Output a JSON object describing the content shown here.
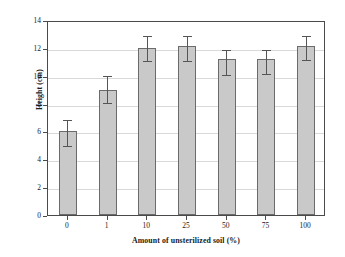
{
  "chart_data": {
    "type": "bar",
    "title": "",
    "xlabel": "Amount of unsterilized soil (%)",
    "ylabel": "Height (cm)",
    "categories": [
      "0",
      "1",
      "10",
      "25",
      "50",
      "75",
      "100"
    ],
    "values": [
      6.0,
      9.0,
      12.0,
      12.1,
      11.2,
      11.2,
      12.1
    ],
    "errors_upper": [
      7.0,
      10.1,
      13.0,
      13.0,
      12.0,
      12.0,
      13.0
    ],
    "errors_lower": [
      5.0,
      8.1,
      11.1,
      11.1,
      10.1,
      10.2,
      11.2
    ],
    "ylim": [
      0,
      14
    ],
    "yticks": [
      0,
      2,
      4,
      6,
      8,
      10,
      12,
      14
    ],
    "ytick_labels": [
      "0",
      "2",
      "4",
      "6",
      "8",
      "10",
      "12",
      "14"
    ],
    "grid": true,
    "grid_axis": "y",
    "legend": "none",
    "bar_fill_color": "#c9c9c9",
    "bar_edge_color": "#6b6b6b",
    "error_bar_color": "#555555",
    "grid_color": "#d9d9d9",
    "axis_color": "#4a4a4a",
    "background_color": "#ffffff"
  }
}
